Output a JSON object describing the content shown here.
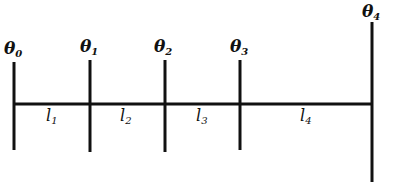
{
  "diagram": {
    "type": "segmented-line-with-nodes",
    "stroke_color": "#111111",
    "background": "#ffffff",
    "main_line": {
      "x1": 14,
      "x2": 372,
      "y": 104
    },
    "nodes": [
      {
        "id": "theta0",
        "symbol": "θ",
        "sub": "0",
        "x": 14,
        "y_top": 62,
        "y_bottom": 150,
        "label_x": 4,
        "label_y": 40
      },
      {
        "id": "theta1",
        "symbol": "θ",
        "sub": "1",
        "x": 90,
        "y_top": 60,
        "y_bottom": 152,
        "label_x": 80,
        "label_y": 38
      },
      {
        "id": "theta2",
        "symbol": "θ",
        "sub": "2",
        "x": 165,
        "y_top": 60,
        "y_bottom": 152,
        "label_x": 154,
        "label_y": 38
      },
      {
        "id": "theta3",
        "symbol": "θ",
        "sub": "3",
        "x": 240,
        "y_top": 60,
        "y_bottom": 150,
        "label_x": 230,
        "label_y": 38
      },
      {
        "id": "theta4",
        "symbol": "θ",
        "sub": "4",
        "x": 372,
        "y_top": 22,
        "y_bottom": 182,
        "label_x": 362,
        "label_y": 3
      }
    ],
    "segments": [
      {
        "id": "l1",
        "symbol": "l",
        "sub": "1",
        "label_x": 46,
        "label_y": 108
      },
      {
        "id": "l2",
        "symbol": "l",
        "sub": "2",
        "label_x": 120,
        "label_y": 108
      },
      {
        "id": "l3",
        "symbol": "l",
        "sub": "3",
        "label_x": 196,
        "label_y": 108
      },
      {
        "id": "l4",
        "symbol": "l",
        "sub": "4",
        "label_x": 300,
        "label_y": 108
      }
    ]
  }
}
